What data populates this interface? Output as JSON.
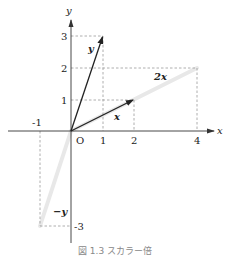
{
  "diagram": {
    "type": "vector-scalar-multiplication",
    "origin_label": "O",
    "axes": {
      "x": {
        "name": "x",
        "ticks": [
          "-1",
          "1",
          "2",
          "4"
        ]
      },
      "y": {
        "name": "y",
        "ticks": [
          "1",
          "2",
          "3",
          "-3"
        ]
      }
    },
    "vectors": [
      {
        "name": "x",
        "label": "x",
        "components": [
          2,
          1
        ]
      },
      {
        "name": "y",
        "label": "y",
        "components": [
          1,
          3
        ]
      },
      {
        "name": "2x",
        "label": "2x",
        "components": [
          4,
          2
        ]
      },
      {
        "name": "-y",
        "label": "−y",
        "components": [
          -1,
          -3
        ]
      }
    ],
    "colors": {
      "axis": "#333333",
      "vector": "#222222",
      "scaled": "#e6e6e6",
      "guide": "#999999"
    },
    "caption": "図 1.3 スカラー倍"
  }
}
